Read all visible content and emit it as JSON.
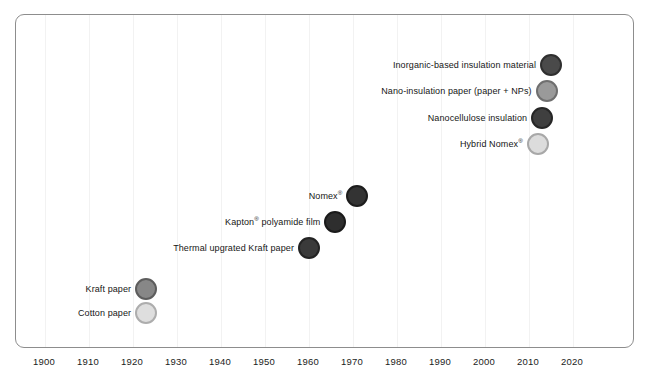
{
  "chart_data": {
    "type": "scatter",
    "title": "",
    "xlabel": "",
    "ylabel": "",
    "xlim": [
      1895,
      2024
    ],
    "ylim": [
      0,
      11
    ],
    "grid": true,
    "legend": "none",
    "x_ticks": [
      1900,
      1910,
      1920,
      1930,
      1940,
      1950,
      1960,
      1970,
      1980,
      1990,
      2000,
      2010,
      2020
    ],
    "x_tick_labels": [
      "1900",
      "1910",
      "1920",
      "1930",
      "1940",
      "1950",
      "1960",
      "1970",
      "1980",
      "1990",
      "2000",
      "2010",
      "2020"
    ],
    "points": [
      {
        "label": "Inorganic-based insulation material",
        "label_html": "Inorganic-based insulation material",
        "x": 2015,
        "y": 10,
        "fill": "#4a4a4a",
        "ring": "#2f2f2f"
      },
      {
        "label": "Nano-insulation paper (paper + NPs)",
        "label_html": "Nano-insulation paper (paper + NPs)",
        "x": 2014,
        "y": 9,
        "fill": "#9a9a9a",
        "ring": "#6f6f6f"
      },
      {
        "label": "Nanocellulose insulation",
        "label_html": "Nanocellulose insulation",
        "x": 2013,
        "y": 8,
        "fill": "#3f3f3f",
        "ring": "#262626"
      },
      {
        "label": "Hybrid Nomex®",
        "label_html": "Hybrid Nomex<sup>®</sup>",
        "x": 2012,
        "y": 7,
        "fill": "#dcdcdc",
        "ring": "#a8a8a8"
      },
      {
        "label": "Nomex®",
        "label_html": "Nomex<sup>®</sup>",
        "x": 1971,
        "y": 5,
        "fill": "#333333",
        "ring": "#1c1c1c"
      },
      {
        "label": "Kapton® polyamide film",
        "label_html": "Kapton<sup>®</sup> polyamide film",
        "x": 1966,
        "y": 4,
        "fill": "#2e2e2e",
        "ring": "#1a1a1a"
      },
      {
        "label": "Thermal upgrated Kraft paper",
        "label_html": "Thermal upgrated Kraft paper",
        "x": 1960,
        "y": 3,
        "fill": "#3a3a3a",
        "ring": "#232323"
      },
      {
        "label": "Kraft paper",
        "label_html": "Kraft paper",
        "x": 1923,
        "y": 1.45,
        "fill": "#878787",
        "ring": "#5d5d5d"
      },
      {
        "label": "Cotton paper",
        "label_html": "Cotton paper",
        "x": 1923,
        "y": 0.55,
        "fill": "#dedede",
        "ring": "#adadad"
      }
    ]
  },
  "colors": {
    "frame_border": "#8d8d8d",
    "gridline": "#f2f2f2",
    "text": "#161616",
    "background": "#ffffff"
  }
}
